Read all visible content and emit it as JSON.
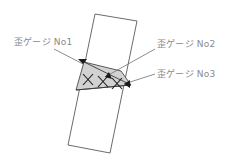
{
  "figure": {
    "type": "technical-diagram",
    "background_color": "#ffffff"
  },
  "specimen": {
    "name": "specimen-outline",
    "stroke_color": "#5a5a5a",
    "fill_color": "#ffffff",
    "points": "95,14 137,21 110,153 68,145"
  },
  "fracture_zone": {
    "name": "shaded-fracture-region",
    "fill_color": "#d2d2d2",
    "stroke_color": "#4a4a4a",
    "points": "84,62 121,71 131,85 76,90"
  },
  "crack_lines": [
    {
      "name": "crack-line-upper",
      "points": "84,62 131,85"
    },
    {
      "name": "crack-line-lower",
      "points": "76,90 131,85"
    }
  ],
  "gauges": [
    {
      "id": "no1",
      "label": "歪ゲージ No1",
      "marker": "x-marker",
      "cx": 88,
      "cy": 80,
      "anchor_x": 83,
      "anchor_y": 64,
      "leader": "54,49 83,64"
    },
    {
      "id": "no2",
      "label": "歪ゲージ No2",
      "marker": "x-marker",
      "cx": 103,
      "cy": 81,
      "anchor_x": 105,
      "anchor_y": 77,
      "leader": "155,49 105,77"
    },
    {
      "id": "no3",
      "label": "歪ゲージ No3",
      "marker": "x-marker",
      "cx": 117,
      "cy": 84,
      "anchor_x": 124,
      "anchor_y": 84,
      "leader": "155,74 124,84"
    }
  ],
  "style": {
    "label_color": "#8a8a8a",
    "leader_color": "#6e6e6e",
    "marker_color": "#1a1a1a"
  }
}
